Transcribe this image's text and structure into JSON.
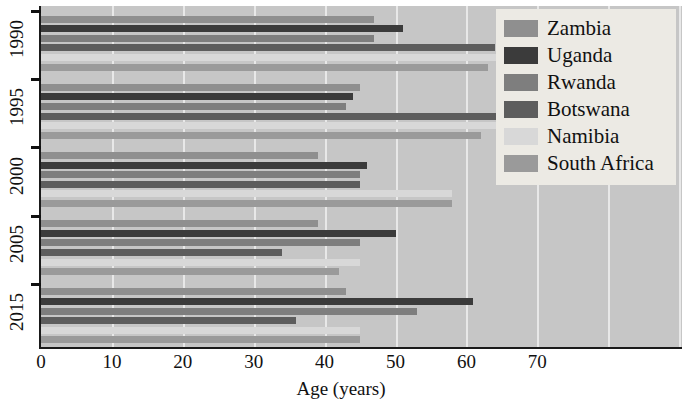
{
  "chart_data": {
    "type": "bar",
    "orientation": "horizontal",
    "title": "",
    "xlabel": "Age (years)",
    "ylabel": "",
    "xlim": [
      0,
      90
    ],
    "xticks": [
      0,
      10,
      20,
      30,
      40,
      50,
      60,
      70
    ],
    "categories": [
      "1990",
      "1995",
      "2000",
      "2005",
      "2015"
    ],
    "legend_position": "top-right",
    "grid": "vertical-white",
    "series": [
      {
        "name": "Zambia",
        "color": "#8f8f8f",
        "values": [
          47,
          45,
          39,
          39,
          43
        ]
      },
      {
        "name": "Uganda",
        "color": "#3b3b3b",
        "values": [
          51,
          44,
          46,
          50,
          61
        ]
      },
      {
        "name": "Rwanda",
        "color": "#7e7e7e",
        "values": [
          47,
          43,
          45,
          45,
          53
        ]
      },
      {
        "name": "Botswana",
        "color": "#5d5d5d",
        "values": [
          64,
          65,
          45,
          34,
          36
        ]
      },
      {
        "name": "Namibia",
        "color": "#d8d8d8",
        "values": [
          68,
          67,
          58,
          45,
          45
        ]
      },
      {
        "name": "South Africa",
        "color": "#9a9a9a",
        "values": [
          63,
          62,
          58,
          42,
          45
        ]
      }
    ]
  },
  "legend": {
    "items": [
      {
        "label": "Zambia"
      },
      {
        "label": "Uganda"
      },
      {
        "label": "Rwanda"
      },
      {
        "label": "Botswana"
      },
      {
        "label": "Namibia"
      },
      {
        "label": "South Africa"
      }
    ]
  },
  "axis": {
    "x_title": "Age (years)",
    "x_ticks": [
      "0",
      "10",
      "20",
      "30",
      "40",
      "50",
      "60",
      "70"
    ],
    "y_ticks": [
      "1990",
      "1995",
      "2000",
      "2005",
      "2015"
    ]
  },
  "colors": {
    "plot_background": "#c6c6c6",
    "gridline": "#e8e8e8",
    "axis": "#1a1a1a",
    "legend_background": "#eceae4"
  }
}
